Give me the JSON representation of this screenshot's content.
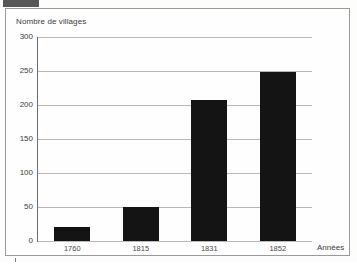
{
  "figure": {
    "background_color": "#fdfdfb",
    "frame_color": "#9a9a9a",
    "bar_color": "#141414",
    "grid_color": "#b9b9b9",
    "axis_color": "#6e6e6e"
  },
  "chart_data": {
    "type": "bar",
    "title": "",
    "categories": [
      "1760",
      "1815",
      "1831",
      "1852"
    ],
    "values": [
      20,
      50,
      208,
      248
    ],
    "xlabel": "Années",
    "ylabel": "Nombre de villages",
    "ylim": [
      0,
      300
    ],
    "yticks": [
      0,
      50,
      100,
      150,
      200,
      250,
      300
    ],
    "ytick_labels": [
      "0",
      "50",
      "100",
      "150",
      "200",
      "250",
      "300"
    ],
    "grid": "horizontal",
    "legend": "none",
    "series": [
      {
        "name": "Nombre de villages",
        "values": [
          20,
          50,
          208,
          248
        ]
      }
    ]
  }
}
